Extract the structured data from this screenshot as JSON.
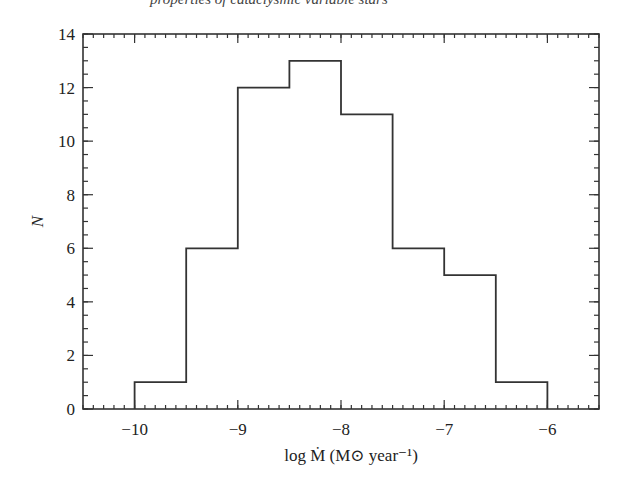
{
  "header": {
    "cutoff_text": "properties of cataclysmic variable stars"
  },
  "chart_data": {
    "type": "bar",
    "style": "step-histogram",
    "title": "",
    "xlabel": "log Ṁ (M⊙ year⁻¹)",
    "ylabel": "N",
    "bin_edges": [
      -10,
      -9.5,
      -9,
      -8.5,
      -8,
      -7.5,
      -7,
      -6.5,
      -6
    ],
    "categories": [
      "-10 to -9.5",
      "-9.5 to -9",
      "-9 to -8.5",
      "-8.5 to -8",
      "-8 to -7.5",
      "-7.5 to -7",
      "-7 to -6.5",
      "-6.5 to -6"
    ],
    "values": [
      1,
      6,
      12,
      13,
      11,
      6,
      5,
      1
    ],
    "xlim": [
      -10.5,
      -5.5
    ],
    "ylim": [
      0,
      14
    ],
    "xticks": [
      -10,
      -9,
      -8,
      -7,
      -6
    ],
    "xtick_labels": [
      "−10",
      "−9",
      "−8",
      "−7",
      "−6"
    ],
    "yticks": [
      0,
      2,
      4,
      6,
      8,
      10,
      12,
      14
    ],
    "ytick_labels": [
      "0",
      "2",
      "4",
      "6",
      "8",
      "10",
      "12",
      "14"
    ],
    "x_minor_step": 0.1,
    "y_minor_step": 0.5,
    "grid": false,
    "legend": null,
    "line_color": "#333333"
  }
}
